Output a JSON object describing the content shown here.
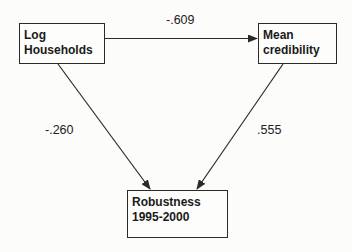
{
  "diagram": {
    "type": "path diagram",
    "nodes": [
      {
        "id": "log_households",
        "lines": [
          "Log",
          "Households"
        ]
      },
      {
        "id": "mean_credibility",
        "lines": [
          "Mean",
          "credibility"
        ]
      },
      {
        "id": "robustness",
        "lines": [
          "Robustness",
          "1995-2000"
        ]
      }
    ],
    "edges": [
      {
        "from": "log_households",
        "to": "mean_credibility",
        "coefficient": "-.609"
      },
      {
        "from": "log_households",
        "to": "robustness",
        "coefficient": "-.260"
      },
      {
        "from": "mean_credibility",
        "to": "robustness",
        "coefficient": ".555"
      }
    ],
    "colors": {
      "background": "#fcfcfa",
      "stroke": "#2a2a2a",
      "text": "#1a1a1a"
    }
  }
}
